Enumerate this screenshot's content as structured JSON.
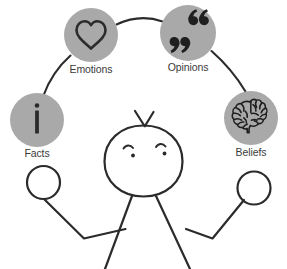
{
  "diagram": {
    "background_color": "#ffffff",
    "circle_fill": "#a9a9a9",
    "ink_color": "#2b2b2b",
    "label_color": "#3b3b3b",
    "arc_color": "#2b2b2b",
    "nodes": [
      {
        "id": "facts",
        "label": "Facts",
        "icon": "information-i-icon",
        "icon_glyph": "i",
        "cx": 37,
        "cy": 120,
        "r": 27,
        "label_x": 37,
        "label_y": 157
      },
      {
        "id": "emotions",
        "label": "Emotions",
        "icon": "heart-icon",
        "icon_glyph": "♡",
        "cx": 91,
        "cy": 35,
        "r": 27,
        "label_x": 91,
        "label_y": 73
      },
      {
        "id": "opinions",
        "label": "Opinions",
        "icon": "quotation-marks-icon",
        "icon_glyph": "“ ”",
        "cx": 188,
        "cy": 33,
        "r": 28,
        "label_x": 188,
        "label_y": 71
      },
      {
        "id": "beliefs",
        "label": "Beliefs",
        "icon": "brain-icon",
        "icon_glyph": "🧠",
        "cx": 251,
        "cy": 118,
        "r": 27,
        "label_x": 251,
        "label_y": 156
      }
    ],
    "connectors": [
      {
        "id": "facts-to-emotions",
        "from": "facts",
        "to": "emotions"
      },
      {
        "id": "emotions-to-opinions",
        "from": "emotions",
        "to": "opinions"
      },
      {
        "id": "opinions-to-beliefs",
        "from": "opinions",
        "to": "beliefs"
      }
    ],
    "figure": {
      "name": "stick-figure-juggler",
      "parts": [
        "head-oval",
        "antenna-hair-left",
        "antenna-hair-right",
        "eyebrow-left",
        "eyebrow-right",
        "eye-left",
        "eye-right",
        "arm-left",
        "arm-right",
        "hand-ball-left",
        "hand-ball-right",
        "leg-left",
        "leg-right"
      ]
    }
  }
}
